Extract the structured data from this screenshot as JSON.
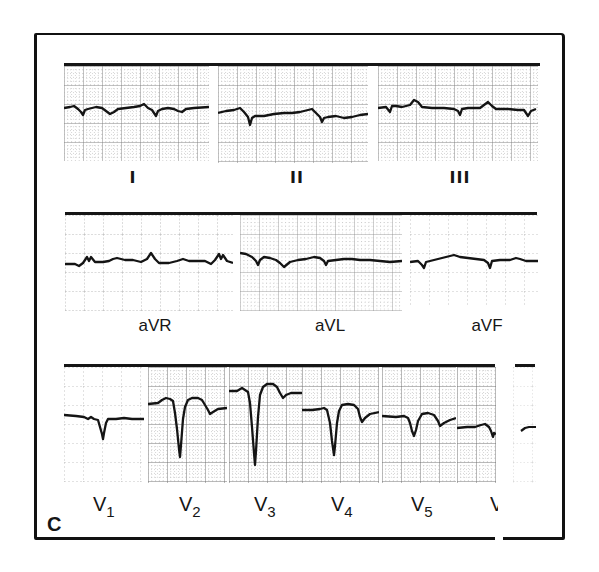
{
  "figure": {
    "panel_letter": "C",
    "ink_color": "#161616",
    "grid_color": "#6b6b6b",
    "background": "#ffffff"
  },
  "rows": [
    {
      "name": "limb-leads",
      "leads": [
        {
          "id": "I",
          "label": "I"
        },
        {
          "id": "II",
          "label": "II"
        },
        {
          "id": "III",
          "label": "III"
        }
      ]
    },
    {
      "name": "augmented-leads",
      "leads": [
        {
          "id": "aVR",
          "label": "aVR"
        },
        {
          "id": "aVL",
          "label": "aVL"
        },
        {
          "id": "aVF",
          "label": "aVF"
        }
      ]
    },
    {
      "name": "precordial-leads",
      "leads": [
        {
          "id": "V1",
          "label": "V",
          "sub": "1"
        },
        {
          "id": "V2",
          "label": "V",
          "sub": "2"
        },
        {
          "id": "V3",
          "label": "V",
          "sub": "3"
        },
        {
          "id": "V4",
          "label": "V",
          "sub": "4"
        },
        {
          "id": "V5",
          "label": "V",
          "sub": "5"
        },
        {
          "id": "V6",
          "label": "V",
          "sub": ""
        }
      ]
    }
  ]
}
